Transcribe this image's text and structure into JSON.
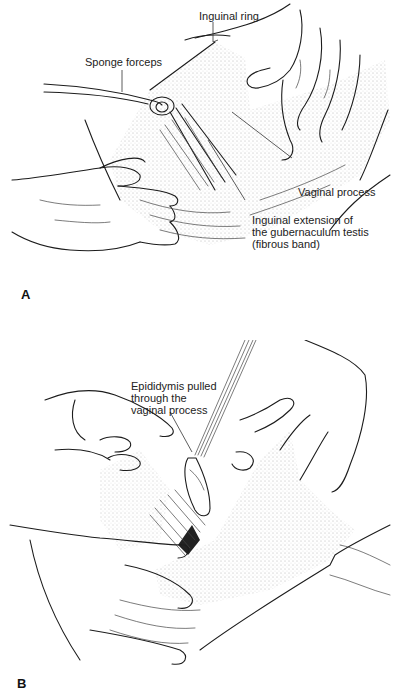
{
  "figure": {
    "panels": [
      {
        "id": "A",
        "letter": "A",
        "labels": [
          {
            "key": "inguinal_ring",
            "text": "Inguinal ring"
          },
          {
            "key": "sponge_forceps",
            "text": "Sponge forceps"
          },
          {
            "key": "vaginal_process",
            "text": "Vaginal process"
          },
          {
            "key": "inguinal_extension_line1",
            "text": "Inguinal extension of"
          },
          {
            "key": "inguinal_extension_line2",
            "text": "the gubernaculum testis"
          },
          {
            "key": "inguinal_extension_line3",
            "text": "(fibrous band)"
          }
        ]
      },
      {
        "id": "B",
        "letter": "B",
        "labels": [
          {
            "key": "epididymis_line1",
            "text": "Epididymis pulled"
          },
          {
            "key": "epididymis_line2",
            "text": "through the"
          },
          {
            "key": "epididymis_line3",
            "text": "vaginal process"
          }
        ]
      }
    ]
  }
}
